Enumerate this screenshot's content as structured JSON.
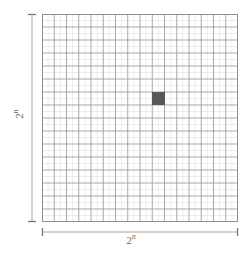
{
  "figure": {
    "background_color": "#ffffff"
  },
  "grid": {
    "major_columns": 16,
    "major_rows": 16,
    "minor_per_major": 2,
    "major_line_color": "#9a9a9a",
    "minor_line_color": "#e2e2e2",
    "border_color": "#8f8f8f",
    "left": 42,
    "top": 14,
    "width": 196,
    "height": 208
  },
  "highlight": {
    "name": "highlighted-cell",
    "column": 10,
    "row": 7,
    "fill_color": "#585858"
  },
  "axes": {
    "vertical": {
      "label_base": "2",
      "label_exponent": "n",
      "measure_color": "#9a9a9a"
    },
    "horizontal": {
      "label_base": "2",
      "label_exponent": "n",
      "measure_color": "#9a9a9a"
    }
  }
}
